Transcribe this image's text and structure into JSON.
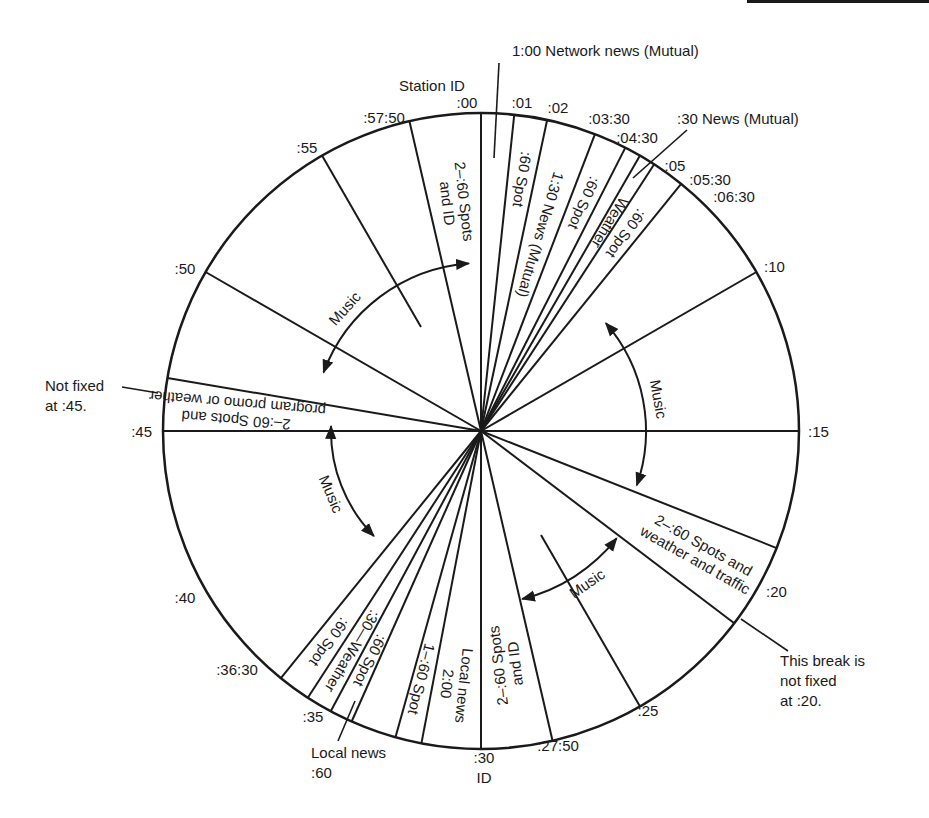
{
  "diagram": {
    "center": [
      481,
      431
    ],
    "radius": 318,
    "line_color": "#1a1a1a",
    "radial_lines": [
      {
        "minute": 0,
        "r0": 0
      },
      {
        "minute": 1,
        "r0": 0
      },
      {
        "minute": 2,
        "r0": 0
      },
      {
        "minute": 3.5,
        "r0": 0
      },
      {
        "minute": 4.5,
        "r0": 0
      },
      {
        "minute": 5,
        "r0": 0
      },
      {
        "minute": 5.5,
        "r0": 0
      },
      {
        "minute": 6.5,
        "r0": 0
      },
      {
        "minute": 10,
        "r0": 0
      },
      {
        "minute": 15,
        "r0": 0
      },
      {
        "minute": 18.6,
        "r0": 0
      },
      {
        "minute": 21.2,
        "r0": 0
      },
      {
        "minute": 25,
        "r0": 120
      },
      {
        "minute": 27.833,
        "r0": 0
      },
      {
        "minute": 30,
        "r0": 0
      },
      {
        "minute": 31.8,
        "r0": 0
      },
      {
        "minute": 32.6,
        "r0": 0
      },
      {
        "minute": 34,
        "r0": 0
      },
      {
        "minute": 34.7,
        "r0": 0
      },
      {
        "minute": 35.5,
        "r0": 0
      },
      {
        "minute": 36.5,
        "r0": 0
      },
      {
        "minute": 45,
        "r0": 0
      },
      {
        "minute": 46.6,
        "r0": 0
      },
      {
        "minute": 50,
        "r0": 0
      },
      {
        "minute": 55,
        "r0": 120
      },
      {
        "minute": 57.833,
        "r0": 0
      }
    ],
    "time_labels": [
      {
        "text": ":00",
        "x": 467,
        "y": 108,
        "anchor": "middle"
      },
      {
        "text": ":01",
        "x": 522,
        "y": 108,
        "anchor": "middle"
      },
      {
        "text": ":02",
        "x": 558,
        "y": 113,
        "anchor": "middle"
      },
      {
        "text": ":03:30",
        "x": 609,
        "y": 124,
        "anchor": "middle"
      },
      {
        "text": ":04:30",
        "x": 637,
        "y": 143,
        "anchor": "middle"
      },
      {
        "text": ":05",
        "x": 675,
        "y": 171,
        "anchor": "middle"
      },
      {
        "text": ":05:30",
        "x": 710,
        "y": 185,
        "anchor": "middle"
      },
      {
        "text": ":06:30",
        "x": 734,
        "y": 202,
        "anchor": "middle"
      },
      {
        "text": ":10",
        "x": 764,
        "y": 272,
        "anchor": "start"
      },
      {
        "text": ":15",
        "x": 808,
        "y": 437,
        "anchor": "start"
      },
      {
        "text": ":20",
        "x": 766,
        "y": 597,
        "anchor": "start"
      },
      {
        "text": ":25",
        "x": 648,
        "y": 716,
        "anchor": "middle"
      },
      {
        "text": ":27:50",
        "x": 558,
        "y": 751,
        "anchor": "middle"
      },
      {
        "text": ":30",
        "x": 484,
        "y": 763,
        "anchor": "middle"
      },
      {
        "text": "ID",
        "x": 484,
        "y": 783,
        "anchor": "middle"
      },
      {
        "text": ":35",
        "x": 313,
        "y": 722,
        "anchor": "middle"
      },
      {
        "text": ":36:30",
        "x": 237,
        "y": 675,
        "anchor": "middle"
      },
      {
        "text": ":40",
        "x": 185,
        "y": 603,
        "anchor": "middle"
      },
      {
        "text": ":45",
        "x": 152,
        "y": 437,
        "anchor": "end"
      },
      {
        "text": ":50",
        "x": 185,
        "y": 274,
        "anchor": "middle"
      },
      {
        "text": ":55",
        "x": 307,
        "y": 153,
        "anchor": "middle"
      },
      {
        "text": ":57:50",
        "x": 384,
        "y": 123,
        "anchor": "middle"
      }
    ],
    "segment_labels": [
      {
        "lines": [
          "2–:60 Spots",
          "and ID"
        ],
        "minute": 58.9,
        "r": 230,
        "flip": true
      },
      {
        "lines": [
          ":60 Spot"
        ],
        "minute": 1.5,
        "r": 255,
        "flip": true
      },
      {
        "lines": [
          "1:30 News (Mutual)"
        ],
        "minute": 2.75,
        "r": 205,
        "flip": true
      },
      {
        "lines": [
          ":60 Spot"
        ],
        "minute": 4.0,
        "r": 250,
        "flip": true
      },
      {
        "lines": [
          "Weather"
        ],
        "minute": 5.25,
        "r": 245,
        "flip": true
      },
      {
        "lines": [
          ":60 Spot"
        ],
        "minute": 6.0,
        "r": 245,
        "flip": true
      },
      {
        "lines": [
          "2–:60 Spots and",
          "weather and traffic"
        ],
        "minute": 19.9,
        "r": 250,
        "flip": false
      },
      {
        "lines": [
          "2–:60 Spots",
          "and ID"
        ],
        "minute": 28.9,
        "r": 235,
        "flip": true
      },
      {
        "lines": [
          "Local news",
          "2:00"
        ],
        "minute": 31.0,
        "r": 255,
        "flip": false
      },
      {
        "lines": [
          "1–:60 Spot"
        ],
        "minute": 32.3,
        "r": 255,
        "flip": false
      },
      {
        "lines": [
          ":60 Spot"
        ],
        "minute": 34.35,
        "r": 255,
        "flip": false
      },
      {
        "lines": [
          ":30—Weather"
        ],
        "minute": 35.1,
        "r": 255,
        "flip": false
      },
      {
        "lines": [
          ":60 Spot"
        ],
        "minute": 36.0,
        "r": 260,
        "flip": false
      },
      {
        "lines": [
          "2–:60 Spots and",
          "program promo or weather"
        ],
        "minute": 45.8,
        "r": 245,
        "flip": false
      }
    ],
    "music_arcs": [
      {
        "label": "Music",
        "from": 48.4,
        "to": 59.3,
        "r": 168,
        "label_minute": 52.0
      },
      {
        "label": "Music",
        "from": 8.2,
        "to": 18.2,
        "r": 165,
        "label_minute": 13.3
      },
      {
        "label": "Music",
        "from": 21.4,
        "to": 27.7,
        "r": 173,
        "label_minute": 24.2
      },
      {
        "label": "Music",
        "from": 37.6,
        "to": 45.3,
        "r": 150,
        "label_minute": 41.2
      }
    ],
    "callouts": [
      {
        "lines": [
          "1:00 Network news (Mutual)"
        ],
        "x": 512,
        "y": 56,
        "anchor": "start",
        "leader": [
          [
            499,
            63
          ],
          [
            494,
            158
          ]
        ]
      },
      {
        "lines": [
          "Station ID"
        ],
        "x": 432,
        "y": 91,
        "anchor": "middle",
        "leader": null
      },
      {
        "lines": [
          ":30 News (Mutual)"
        ],
        "x": 677,
        "y": 124,
        "anchor": "start",
        "leader": [
          [
            687,
            130
          ],
          [
            633,
            178
          ]
        ]
      },
      {
        "lines": [
          "Not fixed",
          "at :45."
        ],
        "x": 45,
        "y": 391,
        "anchor": "start",
        "leader": [
          [
            122,
            387
          ],
          [
            158,
            393
          ]
        ]
      },
      {
        "lines": [
          "This break is",
          "not fixed",
          "at :20."
        ],
        "x": 780,
        "y": 666,
        "anchor": "start",
        "leader": [
          [
            741,
            619
          ],
          [
            788,
            651
          ]
        ]
      },
      {
        "lines": [
          "Local news",
          ":60"
        ],
        "x": 311,
        "y": 758,
        "anchor": "start",
        "leader": [
          [
            338,
            741
          ],
          [
            355,
            701
          ]
        ]
      }
    ]
  }
}
